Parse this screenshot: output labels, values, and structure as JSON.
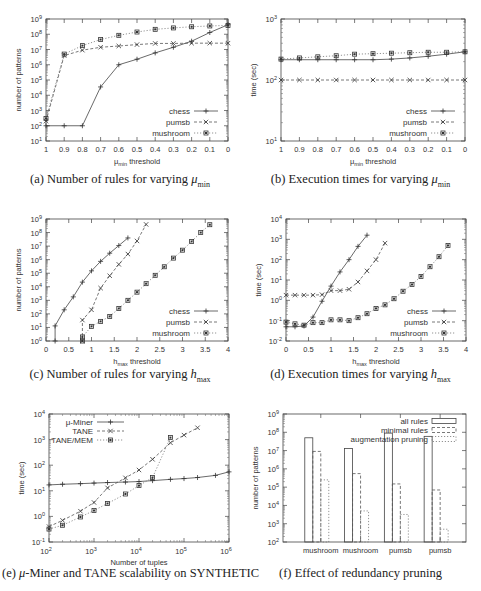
{
  "captions": {
    "a": {
      "prefix": "(a) Number of rules for varying ",
      "math": "μ",
      "sub": "min"
    },
    "b": {
      "prefix": "(b) Execution times for varying ",
      "math": "μ",
      "sub": "min"
    },
    "c": {
      "prefix": "(c) Number of rules for varying ",
      "math": "h",
      "sub": "max"
    },
    "d": {
      "prefix": "(d) Execution times for varying ",
      "math": "h",
      "sub": "max"
    },
    "e": {
      "prefix": "(e) ",
      "math": "μ",
      "suffix": "-Miner and TANE scalability on SYNTHETIC"
    },
    "f": {
      "prefix": "(f) Effect of redundancy pruning"
    }
  },
  "chart_data": [
    {
      "id": "a",
      "type": "line",
      "title": "(a) Number of rules for varying μmin",
      "xlabel": "μmin threshold",
      "ylabel": "number of patterns",
      "xlim": [
        1,
        0
      ],
      "x_reversed": true,
      "ylog": true,
      "ylim_exp": [
        1,
        9
      ],
      "x": [
        1,
        0.9,
        0.8,
        0.7,
        0.6,
        0.5,
        0.4,
        0.3,
        0.2,
        0.1,
        0
      ],
      "xticks": [
        "1",
        "0.9",
        "0.8",
        "0.7",
        "0.6",
        "0.5",
        "0.4",
        "0.3",
        "0.2",
        "0.1",
        "0"
      ],
      "legend_position": "lower right",
      "series": [
        {
          "name": "chess",
          "style": "solid",
          "marker": "+",
          "values": [
            100,
            100,
            100,
            35000,
            1000000,
            2300000,
            6000000,
            14000000,
            35000000,
            130000000,
            420000000
          ]
        },
        {
          "name": "pumsb",
          "style": "dashed",
          "marker": "x",
          "values": [
            200,
            4000000,
            9000000,
            14000000,
            17000000,
            21000000,
            25000000,
            25000000,
            26000000,
            26000000,
            26000000
          ]
        },
        {
          "name": "mushroom",
          "style": "dotted",
          "marker": "*",
          "values": [
            300,
            5000000,
            18000000,
            45000000,
            85000000,
            140000000,
            210000000,
            260000000,
            310000000,
            350000000,
            380000000
          ]
        }
      ]
    },
    {
      "id": "b",
      "type": "line",
      "title": "(b) Execution times for varying μmin",
      "xlabel": "μmin threshold",
      "ylabel": "time (sec)",
      "xlim": [
        1,
        0
      ],
      "x_reversed": true,
      "ylog": true,
      "ylim_exp": [
        1,
        3
      ],
      "x": [
        1,
        0.9,
        0.8,
        0.7,
        0.6,
        0.5,
        0.4,
        0.3,
        0.2,
        0.1,
        0
      ],
      "xticks": [
        "1",
        "0.9",
        "0.8",
        "0.7",
        "0.6",
        "0.5",
        "0.4",
        "0.3",
        "0.2",
        "0.1",
        "0"
      ],
      "legend_position": "lower right",
      "series": [
        {
          "name": "chess",
          "style": "solid",
          "marker": "+",
          "values": [
            215,
            215,
            215,
            215,
            215,
            215,
            220,
            230,
            245,
            265,
            290
          ]
        },
        {
          "name": "pumsb",
          "style": "dashed",
          "marker": "x",
          "values": [
            100,
            100,
            100,
            100,
            100,
            100,
            100,
            100,
            100,
            100,
            100
          ]
        },
        {
          "name": "mushroom",
          "style": "dotted",
          "marker": "*",
          "values": [
            220,
            230,
            240,
            250,
            265,
            270,
            275,
            280,
            285,
            285,
            290
          ]
        }
      ]
    },
    {
      "id": "c",
      "type": "line",
      "title": "(c) Number of rules for varying hmax",
      "xlabel": "hmax threshold",
      "ylabel": "number of patterns",
      "xlim": [
        0,
        4
      ],
      "ylog": true,
      "ylim_exp": [
        0,
        9
      ],
      "xticks": [
        "0",
        "0.5",
        "1",
        "1.5",
        "2",
        "2.5",
        "3",
        "3.5",
        "4"
      ],
      "legend_position": "lower right",
      "series": [
        {
          "name": "chess",
          "style": "solid",
          "marker": "+",
          "x": [
            0.2,
            0.2,
            0.4,
            0.6,
            0.8,
            1.0,
            1.2,
            1.4,
            1.6,
            1.8
          ],
          "values": [
            1,
            13,
            200,
            1800,
            22000,
            150000,
            750000,
            3000000,
            11000000,
            40000000
          ]
        },
        {
          "name": "pumsb",
          "style": "dashed",
          "marker": "x",
          "x": [
            0.8,
            0.8,
            1.0,
            1.2,
            1.4,
            1.6,
            1.8,
            2.0,
            2.2
          ],
          "values": [
            1,
            35,
            200,
            8000,
            65000,
            450000,
            2600000,
            24000000,
            400000000
          ]
        },
        {
          "name": "mushroom",
          "style": "dotted",
          "marker": "*",
          "x": [
            0.8,
            0.8,
            1.0,
            1.2,
            1.4,
            1.6,
            1.8,
            2.0,
            2.2,
            2.4,
            2.6,
            2.8,
            3.0,
            3.2,
            3.4,
            3.6
          ],
          "values": [
            1,
            2,
            12,
            28,
            65,
            250,
            1000,
            4000,
            17000,
            70000,
            300000,
            1300000,
            5000000,
            22000000,
            100000000,
            380000000
          ]
        }
      ]
    },
    {
      "id": "d",
      "type": "line",
      "title": "(d) Execution times for varying hmax",
      "xlabel": "hmax threshold",
      "ylabel": "time (sec)",
      "xlim": [
        0,
        4
      ],
      "ylog": true,
      "ylim_exp": [
        -2,
        4
      ],
      "xticks": [
        "0",
        "0.5",
        "1",
        "1.5",
        "2",
        "2.5",
        "3",
        "3.5",
        "4"
      ],
      "legend_position": "lower right",
      "series": [
        {
          "name": "chess",
          "style": "solid",
          "marker": "+",
          "x": [
            0,
            0.2,
            0.4,
            0.6,
            0.8,
            1.0,
            1.2,
            1.4,
            1.6,
            1.8
          ],
          "values": [
            0.05,
            0.05,
            0.055,
            0.15,
            0.9,
            5,
            25,
            100,
            450,
            1600
          ]
        },
        {
          "name": "pumsb",
          "style": "dashed",
          "marker": "x",
          "x": [
            0,
            0.2,
            0.4,
            0.6,
            0.8,
            1.0,
            1.2,
            1.4,
            1.6,
            1.8,
            2.0,
            2.2
          ],
          "values": [
            1.8,
            1.8,
            1.8,
            1.8,
            1.9,
            3.0,
            3.0,
            3.5,
            8,
            28,
            100,
            650
          ]
        },
        {
          "name": "mushroom",
          "style": "dotted",
          "marker": "*",
          "x": [
            0,
            0.2,
            0.4,
            0.6,
            0.8,
            1.0,
            1.2,
            1.4,
            1.6,
            1.8,
            2.0,
            2.2,
            2.4,
            2.6,
            2.8,
            3.0,
            3.2,
            3.4,
            3.6
          ],
          "values": [
            0.085,
            0.07,
            0.06,
            0.08,
            0.08,
            0.11,
            0.11,
            0.1,
            0.14,
            0.22,
            0.4,
            0.6,
            1.2,
            2.8,
            6,
            15,
            45,
            140,
            500
          ]
        }
      ]
    },
    {
      "id": "e",
      "type": "line",
      "title": "(e) μ-Miner and TANE scalability on SYNTHETIC",
      "xlabel": "Number of tuples",
      "ylabel": "time (sec)",
      "xlog": true,
      "xlim_exp": [
        2,
        6
      ],
      "ylog": true,
      "ylim_exp": [
        -1,
        4
      ],
      "legend_position": "upper left",
      "series": [
        {
          "name": "μ-Miner",
          "style": "solid",
          "marker": "+",
          "x": [
            100,
            200,
            500,
            1000,
            2000,
            5000,
            10000,
            20000,
            50000,
            100000,
            200000,
            500000,
            1000000
          ],
          "values": [
            17,
            18,
            19,
            20,
            21,
            22,
            23,
            25,
            28,
            30,
            33,
            40,
            55
          ]
        },
        {
          "name": "TANE",
          "style": "dashed",
          "marker": "x",
          "x": [
            100,
            200,
            500,
            1000,
            2000,
            5000,
            10000,
            20000,
            50000,
            100000,
            200000
          ],
          "values": [
            0.4,
            0.7,
            1.6,
            3.5,
            13,
            32,
            65,
            170,
            750,
            1500,
            2900
          ]
        },
        {
          "name": "TANE/MEM",
          "style": "dotted",
          "marker": "*",
          "x": [
            100,
            200,
            500,
            1000,
            2000,
            5000,
            10000,
            20000,
            50000
          ],
          "values": [
            0.32,
            0.45,
            0.95,
            1.7,
            3.2,
            7.5,
            16,
            33,
            1200
          ]
        }
      ]
    },
    {
      "id": "f",
      "type": "bar",
      "title": "(f) Effect of redundancy pruning",
      "xlabel": "",
      "ylabel": "number of patterns",
      "ylog": true,
      "ylim_exp": [
        2,
        9
      ],
      "categories": [
        "mushroom",
        "mushroom",
        "pumsb",
        "pumsb"
      ],
      "legend_position": "upper right",
      "series": [
        {
          "name": "all rules",
          "style": "solid",
          "values": [
            50000000,
            13000000,
            90000000,
            60000000
          ]
        },
        {
          "name": "minimal rules",
          "style": "dashed",
          "values": [
            9000000,
            550000,
            150000,
            70000
          ]
        },
        {
          "name": "augmentation pruning",
          "style": "dotted",
          "values": [
            250000,
            5000,
            3200,
            500
          ]
        }
      ]
    }
  ]
}
